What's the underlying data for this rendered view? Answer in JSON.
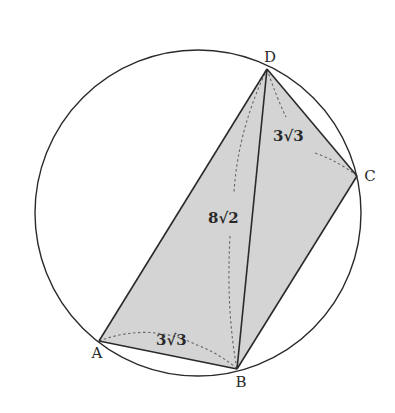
{
  "diagram": {
    "type": "cyclic-quadrilateral",
    "colors": {
      "background": "#ffffff",
      "stroke": "#2a2a2a",
      "fill": "#d4d4d4",
      "dashed": "#666666"
    },
    "circle": {
      "cx": 198,
      "cy": 213,
      "r": 163
    },
    "vertices": {
      "A": {
        "label": "A",
        "x": 99,
        "y": 341,
        "lx": 97,
        "ly": 358
      },
      "B": {
        "label": "B",
        "x": 237,
        "y": 369,
        "lx": 241,
        "ly": 387
      },
      "C": {
        "label": "C",
        "x": 357,
        "y": 176,
        "lx": 370,
        "ly": 181
      },
      "D": {
        "label": "D",
        "x": 267,
        "y": 69,
        "lx": 270,
        "ly": 62
      }
    },
    "segments": [
      "AB",
      "BC",
      "CD",
      "DA",
      "DB"
    ],
    "measurements": {
      "AB": {
        "label": "3√3",
        "coeff": "3",
        "radicand": "3",
        "x": 156,
        "y": 345
      },
      "DB": {
        "label": "8√2",
        "coeff": "8",
        "radicand": "2",
        "x": 208,
        "y": 223
      },
      "DC": {
        "label": "3√3",
        "coeff": "3",
        "radicand": "3",
        "x": 273,
        "y": 141
      }
    }
  }
}
